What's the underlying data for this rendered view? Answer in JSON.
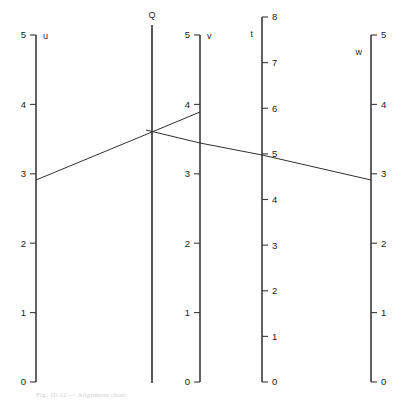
{
  "figure": {
    "type": "nomogram",
    "title": "",
    "background": "#ffffff",
    "line_color": "#3a3a3a",
    "isopleth_color": "#303030",
    "width": 407,
    "height": 405
  },
  "axes": [
    {
      "id": "u",
      "name": "u",
      "x": 36,
      "label_side": "right",
      "tick_side": "left",
      "min": 0,
      "max": 5,
      "y_top": 35,
      "y_bottom": 382,
      "ticks": [
        {
          "value": 5,
          "label": "5"
        },
        {
          "value": 4,
          "label": "4"
        },
        {
          "value": 3,
          "label": "3"
        },
        {
          "value": 2,
          "label": "2"
        },
        {
          "value": 1,
          "label": "1"
        },
        {
          "value": 0,
          "label": "0"
        }
      ]
    },
    {
      "id": "Q",
      "name": "Q",
      "x": 152,
      "label_side": "top",
      "tick_side": "none",
      "min": 0,
      "max": 5,
      "y_top": 25,
      "y_bottom": 383,
      "ticks": []
    },
    {
      "id": "v",
      "name": "v",
      "x": 200,
      "label_side": "right",
      "tick_side": "left",
      "min": 0,
      "max": 5,
      "y_top": 35,
      "y_bottom": 382,
      "ticks": [
        {
          "value": 5,
          "label": "5"
        },
        {
          "value": 4,
          "label": "4"
        },
        {
          "value": 3,
          "label": "3"
        },
        {
          "value": 2,
          "label": "2"
        },
        {
          "value": 1,
          "label": "1"
        },
        {
          "value": 0,
          "label": "0"
        }
      ]
    },
    {
      "id": "t",
      "name": "t",
      "x": 262,
      "label_side": "left",
      "tick_side": "right",
      "min": 0,
      "max": 8,
      "y_top": 17,
      "y_bottom": 382,
      "ticks": [
        {
          "value": 8,
          "label": "8"
        },
        {
          "value": 7,
          "label": "7"
        },
        {
          "value": 6,
          "label": "6"
        },
        {
          "value": 5,
          "label": "5"
        },
        {
          "value": 4,
          "label": "4"
        },
        {
          "value": 3,
          "label": "3"
        },
        {
          "value": 2,
          "label": "2"
        },
        {
          "value": 1,
          "label": "1"
        },
        {
          "value": 0,
          "label": "0"
        }
      ]
    },
    {
      "id": "w",
      "name": "w",
      "x": 371,
      "label_side": "left",
      "tick_side": "right",
      "min": 0,
      "max": 5,
      "y_top": 35,
      "y_bottom": 382,
      "ticks": [
        {
          "value": 5,
          "label": "5"
        },
        {
          "value": 4,
          "label": "4"
        },
        {
          "value": 3,
          "label": "3"
        },
        {
          "value": 2,
          "label": "2"
        },
        {
          "value": 1,
          "label": "1"
        },
        {
          "value": 0,
          "label": "0"
        }
      ]
    }
  ],
  "isopleths": [
    {
      "id": "isopleth-u-Q-v",
      "points": [
        {
          "axis": "u",
          "value": 3,
          "x": 36,
          "y": 180
        },
        {
          "axis": "Q",
          "value": null,
          "x": 152,
          "y": 132
        },
        {
          "axis": "v",
          "value": 4,
          "x": 200,
          "y": 112
        }
      ]
    },
    {
      "id": "isopleth-Q-t-w",
      "points": [
        {
          "axis": "Q",
          "value": null,
          "x": 146,
          "y": 130
        },
        {
          "axis": "v",
          "value": null,
          "x": 200,
          "y": 143
        },
        {
          "axis": "t",
          "value": 5,
          "x": 262,
          "y": 155
        },
        {
          "axis": "w",
          "value": 3,
          "x": 371,
          "y": 180
        }
      ]
    }
  ],
  "caption": {
    "text": "Fig. 10.12 — Alignment chart",
    "visible": false
  },
  "chart_data": {
    "type": "line",
    "xlabel": "",
    "ylabel": "",
    "scales": [
      {
        "name": "u",
        "min": 0,
        "max": 5,
        "ticks": [
          0,
          1,
          2,
          3,
          4,
          5
        ],
        "reading": 3
      },
      {
        "name": "Q",
        "min": null,
        "max": null,
        "ticks": [],
        "reading": null
      },
      {
        "name": "v",
        "min": 0,
        "max": 5,
        "ticks": [
          0,
          1,
          2,
          3,
          4,
          5
        ],
        "reading": 4
      },
      {
        "name": "t",
        "min": 0,
        "max": 8,
        "ticks": [
          0,
          1,
          2,
          3,
          4,
          5,
          6,
          7,
          8
        ],
        "reading": 5
      },
      {
        "name": "w",
        "min": 0,
        "max": 5,
        "ticks": [
          0,
          1,
          2,
          3,
          4,
          5
        ],
        "reading": 3
      }
    ],
    "series": [
      {
        "name": "isopleth-1",
        "axes": [
          "u",
          "Q",
          "v"
        ],
        "values": [
          3,
          null,
          4
        ]
      },
      {
        "name": "isopleth-2",
        "axes": [
          "Q",
          "t",
          "w"
        ],
        "values": [
          null,
          5,
          3
        ]
      }
    ],
    "grid": false,
    "legend": "none"
  }
}
